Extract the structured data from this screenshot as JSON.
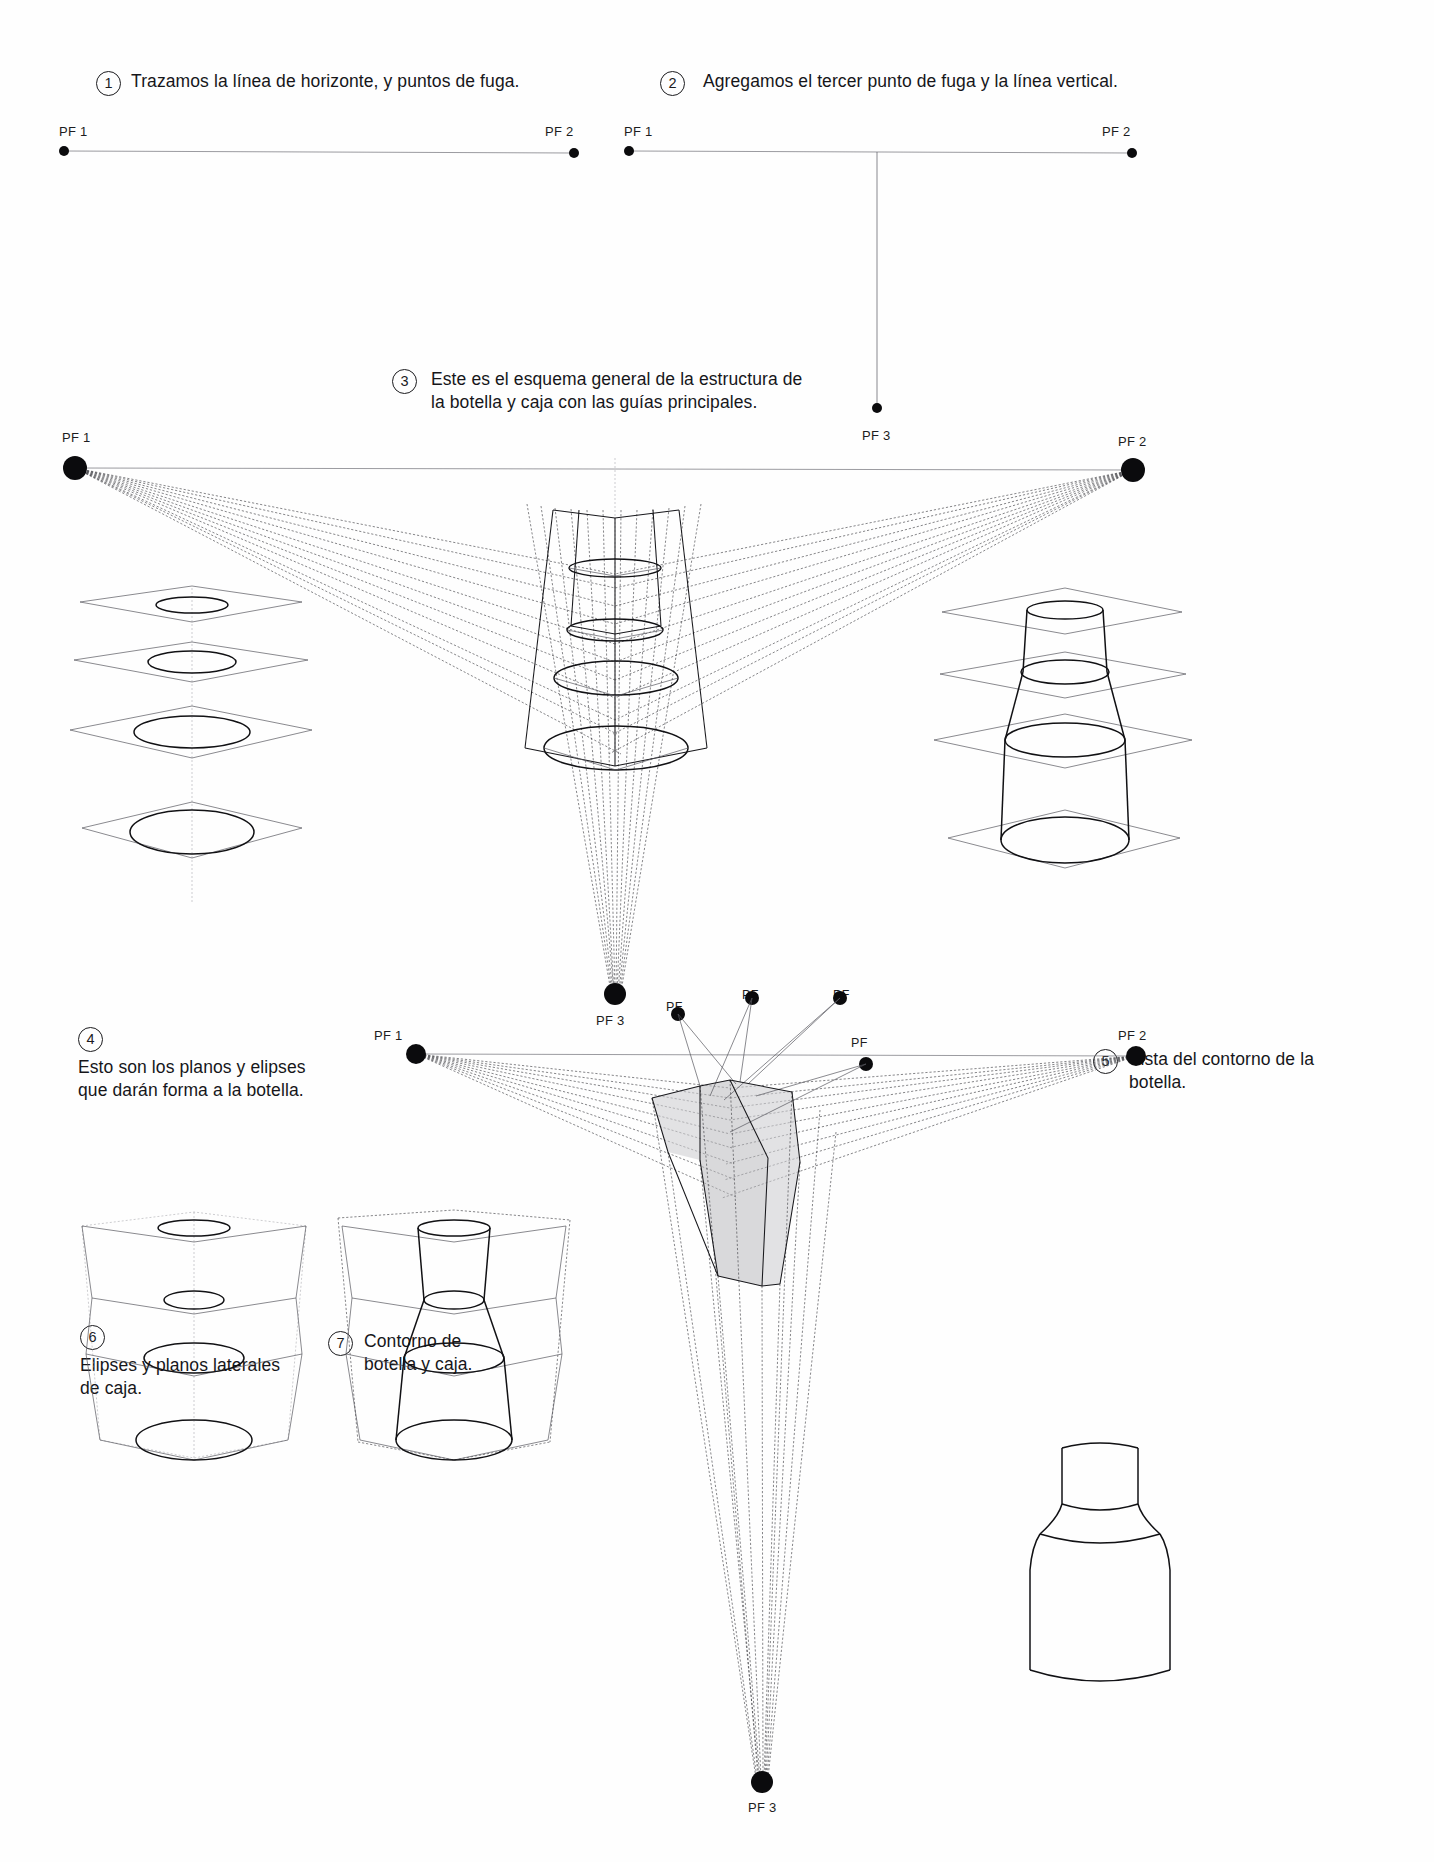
{
  "document": {
    "title": "Construcción de una botella en perspectiva de tres puntos de fuga",
    "language": "es",
    "background_color": "#fefefe",
    "ink_color": "#111114",
    "guide_color": "#8b8b90"
  },
  "steps": [
    {
      "number": "1",
      "caption": "Trazamos la línea de horizonte,  y puntos de fuga."
    },
    {
      "number": "2",
      "caption": "Agregamos el tercer punto de fuga y la línea vertical."
    },
    {
      "number": "3",
      "caption": "Este es el esquema general de la estructura de\nla botella y caja con las guías principales."
    },
    {
      "number": "4",
      "caption": "Esto son los planos y elipses\nque darán forma a la botella."
    },
    {
      "number": "5",
      "caption": "Vista del contorno de la\nbotella."
    },
    {
      "number": "6",
      "caption": "Elipses y planos laterales\nde caja."
    },
    {
      "number": "7",
      "caption": "Contorno de\nbotella y caja."
    }
  ],
  "labels": {
    "pf1": "PF 1",
    "pf2": "PF 2",
    "pf3": "PF 3",
    "pf": "PF"
  },
  "diagram1": {
    "name": "linea-de-horizonte-con-dos-puntos-de-fuga",
    "left_label": "PF 1",
    "right_label": "PF 2"
  },
  "diagram2": {
    "name": "tercer-punto-de-fuga-y-linea-vertical",
    "left_label": "PF 1",
    "right_label": "PF 2"
  },
  "diagram3": {
    "name": "esquema-general-botella-y-caja",
    "left_label": "PF 1",
    "right_label": "PF 2",
    "top_label": "PF 3",
    "bottom_label": "PF 3"
  },
  "diagram4": {
    "name": "planos-y-elipses-de-la-botella"
  },
  "diagram5": {
    "name": "contorno-de-la-botella"
  },
  "diagram6": {
    "name": "elipses-y-planos-laterales-de-caja"
  },
  "diagram7": {
    "name": "contorno-de-botella-y-caja"
  },
  "diagram8": {
    "name": "caja-sombreada-con-puntos-de-fuga-auxiliares",
    "left_label": "PF 1",
    "right_label": "PF 2",
    "bottom_label": "PF 3",
    "aux_labels": [
      "PF",
      "PF",
      "PF",
      "PF"
    ]
  },
  "diagram9": {
    "name": "botella-final-contorno-limpio"
  }
}
